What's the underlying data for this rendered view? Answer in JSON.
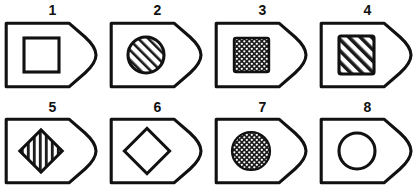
{
  "figure": {
    "title": "",
    "background_color": "#ffffff",
    "stroke_color": "#111111",
    "fill_color": "#1a1a1a",
    "rows": 2,
    "columns": 4,
    "outer_shape_name": "tag-with-rounded-right-end",
    "items": [
      {
        "label": "1",
        "name": "figure-item-1",
        "outer_shape": "tag",
        "inner_shape": "square",
        "inner_fill": "none",
        "inner_pattern": "plain",
        "inner_rotation_deg": 0
      },
      {
        "label": "2",
        "name": "figure-item-2",
        "outer_shape": "tag",
        "inner_shape": "circle",
        "inner_fill": "hatched",
        "inner_pattern": "diagonal-lines",
        "inner_rotation_deg": 0
      },
      {
        "label": "3",
        "name": "figure-item-3",
        "outer_shape": "tag",
        "inner_shape": "square",
        "inner_fill": "stippled",
        "inner_pattern": "dark-with-white-dots",
        "inner_rotation_deg": 0
      },
      {
        "label": "4",
        "name": "figure-item-4",
        "outer_shape": "tag",
        "inner_shape": "square",
        "inner_fill": "hatched",
        "inner_pattern": "diagonal-lines",
        "inner_rotation_deg": 0
      },
      {
        "label": "5",
        "name": "figure-item-5",
        "outer_shape": "tag",
        "inner_shape": "diamond",
        "inner_fill": "hatched",
        "inner_pattern": "diagonal-lines",
        "inner_rotation_deg": 45
      },
      {
        "label": "6",
        "name": "figure-item-6",
        "outer_shape": "tag",
        "inner_shape": "diamond",
        "inner_fill": "none",
        "inner_pattern": "plain",
        "inner_rotation_deg": 45
      },
      {
        "label": "7",
        "name": "figure-item-7",
        "outer_shape": "tag",
        "inner_shape": "circle",
        "inner_fill": "stippled",
        "inner_pattern": "dark-with-white-dots",
        "inner_rotation_deg": 0
      },
      {
        "label": "8",
        "name": "figure-item-8",
        "outer_shape": "tag",
        "inner_shape": "circle",
        "inner_fill": "none",
        "inner_pattern": "plain",
        "inner_rotation_deg": 0
      }
    ]
  }
}
